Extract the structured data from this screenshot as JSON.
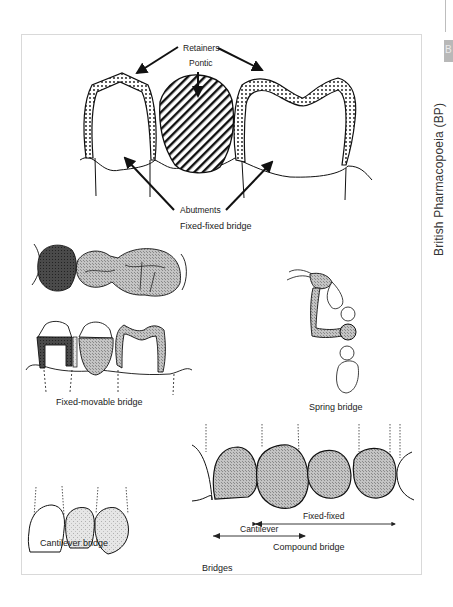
{
  "margin": {
    "running_head": "British Pharmacopoeia (BP)",
    "thumb_tab_letter": "B"
  },
  "figure": {
    "caption": "Bridges",
    "panels": {
      "fixed_fixed": {
        "title": "Fixed-fixed bridge",
        "labels": {
          "retainers": "Retainers",
          "pontic": "Pontic",
          "abutments": "Abutments"
        }
      },
      "fixed_movable": {
        "title": "Fixed-movable bridge"
      },
      "spring": {
        "title": "Spring bridge"
      },
      "cantilever": {
        "title": "Cantilever bridge"
      },
      "compound": {
        "title": "Compound bridge",
        "labels": {
          "fixed_fixed": "Fixed-fixed",
          "cantilever": "Cantilever"
        }
      }
    }
  },
  "colors": {
    "frame_border": "#d9d9d9",
    "ink": "#1a1a1a",
    "stipple_fill": "#bcbcbc",
    "dark_fill": "#3a3a3a",
    "thumb_tab": "#b8b8b8"
  }
}
